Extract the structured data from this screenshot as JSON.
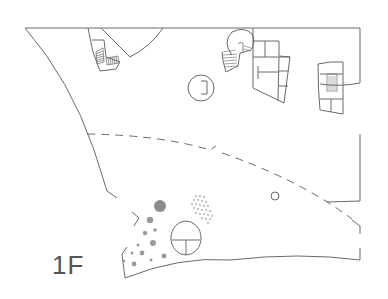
{
  "diagram": {
    "type": "architectural-floor-plan",
    "floor_label": "1F",
    "colors": {
      "line": "#6a6a6a",
      "dots": "#9a9a9a",
      "large_dot": "#8c8c8c",
      "background": "#ffffff"
    },
    "elements": [
      {
        "name": "outer-wall",
        "kind": "outline"
      },
      {
        "name": "curved-room-top",
        "kind": "wedge"
      },
      {
        "name": "stair-left",
        "kind": "staircase"
      },
      {
        "name": "spiral-stair",
        "kind": "spiral-staircase"
      },
      {
        "name": "round-column",
        "kind": "circle"
      },
      {
        "name": "core-center",
        "kind": "rooms-grid"
      },
      {
        "name": "core-right",
        "kind": "rooms-grid-with-stair"
      },
      {
        "name": "dashed-boundary",
        "kind": "dashed-line"
      },
      {
        "name": "small-circle",
        "kind": "circle"
      },
      {
        "name": "round-kiosk",
        "kind": "circle-with-division"
      },
      {
        "name": "gray-dots-cluster",
        "kind": "dot-pattern"
      },
      {
        "name": "dotted-grid-area",
        "kind": "dot-pattern"
      },
      {
        "name": "curved-front-wall",
        "kind": "arc"
      }
    ]
  }
}
